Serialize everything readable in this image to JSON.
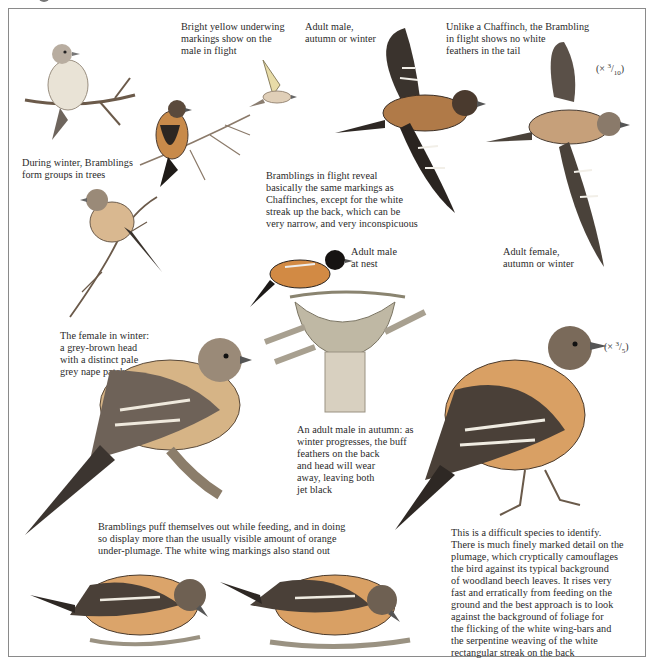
{
  "page": {
    "title_fragment": "g",
    "border_color": "#8a8a8a",
    "background": "#ffffff"
  },
  "captions": {
    "yellow_underwing": "Bright yellow underwing\nmarkings show on the\nmale in flight",
    "adult_male_flight": "Adult male,\nautumn or winter",
    "unlike_chaffinch": "Unlike a Chaffinch, the Brambling\nin flight shows no white\nfeathers in the tail",
    "winter_groups": "During winter, Bramblings\nform groups in trees",
    "flight_reveal": "Bramblings in flight reveal\nbasically the same markings as\nChaffinches, except for the white\nstreak up the back, which can be\nvery narrow, and very inconspicuous",
    "adult_male_nest": "Adult male\nat nest",
    "adult_female_flight": "Adult female,\nautumn or winter",
    "female_winter": "The female in winter:\na grey-brown head\nwith a distinct pale\ngrey nape patch",
    "adult_male_autumn": "An adult male in autumn: as\nwinter progresses, the buff\nfeathers on the back\nand head will wear\naway, leaving both\njet black",
    "feeding": "Bramblings puff themselves out while feeding, and in doing\nso display more than the usually visible amount of orange\nunder-plumage. The white wing markings also stand out",
    "identification": "This is a difficult species to identify.\nThere is much finely marked detail on the\nplumage, which cryptically camouflages\nthe bird against its typical background\nof woodland beech leaves. It rises very\nfast and erratically from feeding on the\nground and the best approach is to look\nagainst the background of foliage for\nthe flicking of the white wing-bars and\nthe serpentine weaving of the white\nrectangular streak on the back"
  },
  "scales": {
    "flight_scale": {
      "prefix": "(× ",
      "num": "3",
      "den": "10",
      "suffix": ")"
    },
    "large_scale": {
      "prefix": "(× ",
      "num": "3",
      "den": "5",
      "suffix": ")"
    }
  },
  "illustrations": [
    {
      "id": "perched-bird-small-1",
      "label": "perched brambling on branch"
    },
    {
      "id": "flying-bird-small",
      "label": "brambling in flight, underwing"
    },
    {
      "id": "perched-bird-small-2",
      "label": "perched brambling in tree"
    },
    {
      "id": "flying-male",
      "label": "adult male in flight"
    },
    {
      "id": "flying-female",
      "label": "adult female in flight"
    },
    {
      "id": "perched-bird-small-3",
      "label": "perched brambling on twig"
    },
    {
      "id": "nest-male",
      "label": "adult male at nest"
    },
    {
      "id": "female-large",
      "label": "female on branch"
    },
    {
      "id": "male-large",
      "label": "adult male in autumn"
    },
    {
      "id": "feeding-1",
      "label": "brambling feeding on ground"
    },
    {
      "id": "feeding-2",
      "label": "brambling feeding on ground"
    }
  ]
}
